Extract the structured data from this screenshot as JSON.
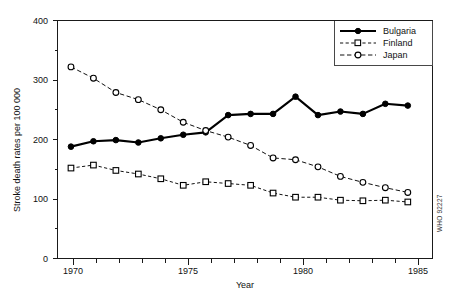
{
  "chart_data": {
    "type": "line",
    "title": "",
    "xlabel": "Year",
    "ylabel": "Stroke death rates per 100 000",
    "xlim": [
      1969.4,
      1986.1
    ],
    "ylim": [
      0,
      400
    ],
    "grid": false,
    "legend_position": "top-right",
    "x": [
      1970,
      1971,
      1972,
      1973,
      1974,
      1975,
      1976,
      1977,
      1978,
      1979,
      1980,
      1981,
      1982,
      1983,
      1984,
      1985
    ],
    "categories": [
      "1970",
      "1971",
      "1972",
      "1973",
      "1974",
      "1975",
      "1976",
      "1977",
      "1978",
      "1979",
      "1980",
      "1981",
      "1982",
      "1983",
      "1984",
      "1985"
    ],
    "x_tick_labels": [
      "1970",
      "1975",
      "1980",
      "1985"
    ],
    "x_tick_values": [
      1970,
      1975,
      1980,
      1985
    ],
    "x_minor_tick_values": [
      1971,
      1972,
      1973,
      1974,
      1976,
      1977,
      1978,
      1979,
      1981,
      1982,
      1983,
      1984
    ],
    "y_tick_labels": [
      "0",
      "100",
      "200",
      "300",
      "400"
    ],
    "y_tick_values": [
      0,
      100,
      200,
      300,
      400
    ],
    "y_minor_tick_values": [
      50,
      150,
      250,
      350
    ],
    "series": [
      {
        "name": "Bulgaria",
        "marker": "filled-circle",
        "line_style": "solid",
        "color": "#000000",
        "values": [
          188,
          197,
          199,
          195,
          202,
          208,
          212,
          241,
          243,
          243,
          272,
          241,
          247,
          243,
          260,
          257
        ]
      },
      {
        "name": "Finland",
        "marker": "open-square",
        "line_style": "dashed",
        "color": "#111111",
        "values": [
          152,
          157,
          148,
          142,
          134,
          123,
          129,
          126,
          123,
          110,
          103,
          103,
          98,
          97,
          98,
          95
        ]
      },
      {
        "name": "Japan",
        "marker": "open-circle",
        "line_style": "dash-dot",
        "color": "#111111",
        "values": [
          322,
          303,
          279,
          267,
          250,
          229,
          215,
          204,
          190,
          169,
          166,
          154,
          138,
          128,
          119,
          111
        ]
      }
    ],
    "annotations": [
      {
        "text": "WHO 92227",
        "position": "right-edge-vertical"
      }
    ]
  },
  "legend": {
    "items": [
      {
        "label": "Bulgaria"
      },
      {
        "label": "Finland"
      },
      {
        "label": "Japan"
      }
    ]
  },
  "credit": {
    "text": "WHO 92227"
  }
}
